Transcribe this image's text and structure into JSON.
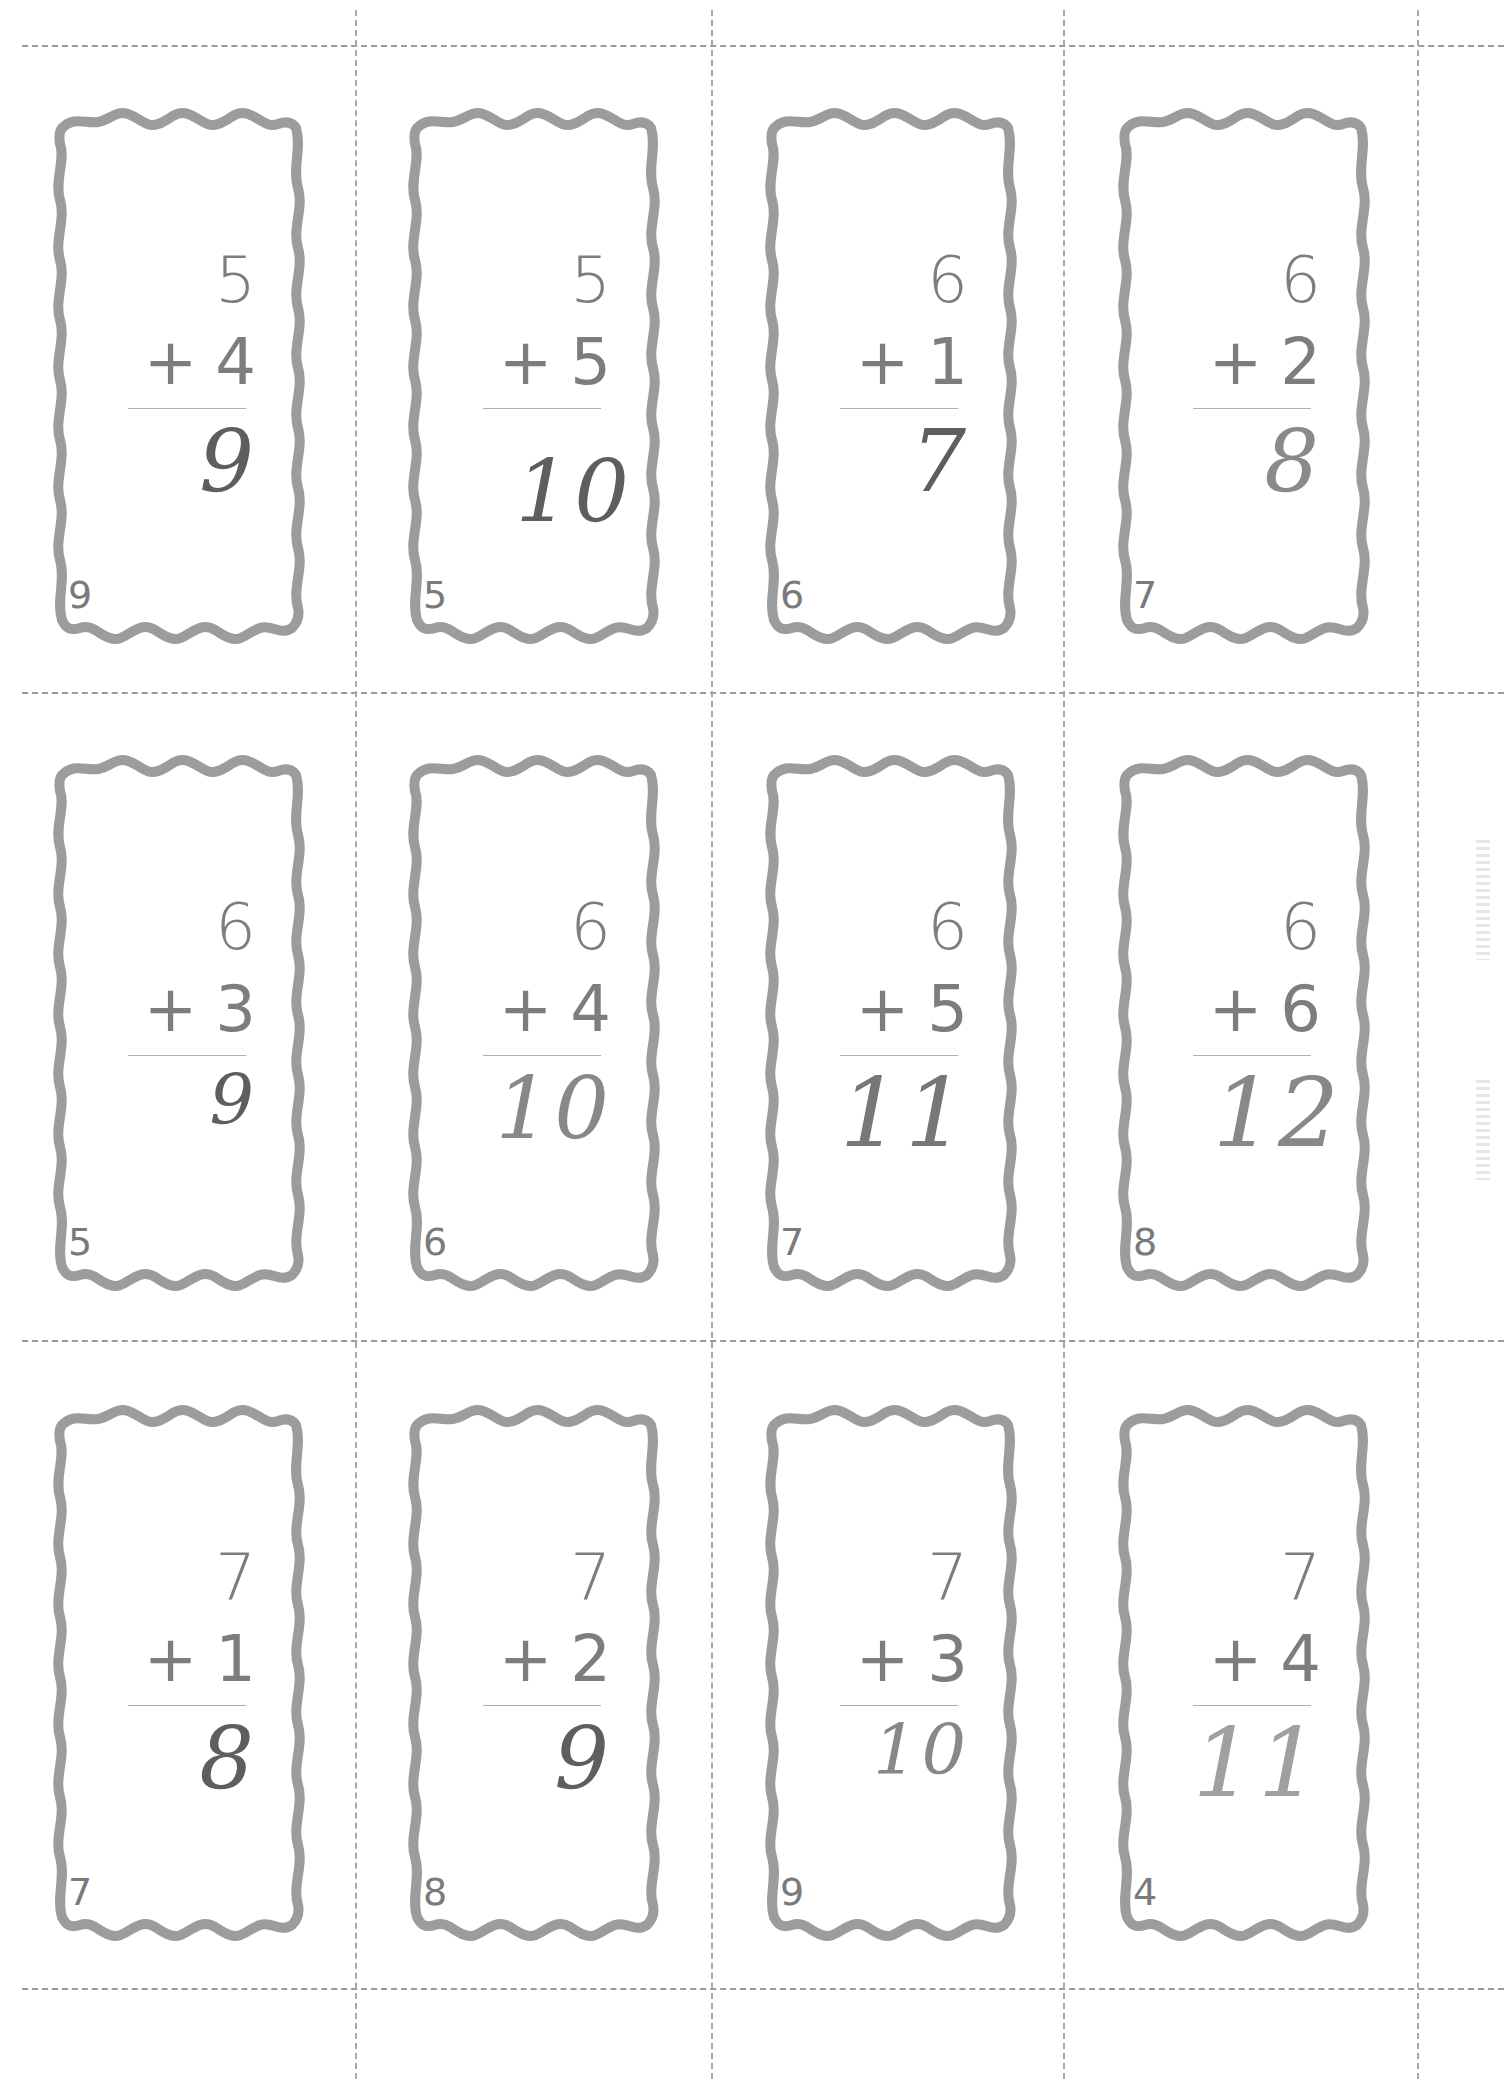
{
  "document": {
    "type": "addition flash cards worksheet",
    "colors": {
      "frame": "#9c9c9c",
      "printed_text": "#7d7d7d",
      "handwriting": "#5e5e5e",
      "cut_lines": "#9a9a9a"
    }
  },
  "rows": [
    {
      "cards": [
        {
          "top": "5",
          "operator": "+",
          "bottom": "4",
          "answer": "9",
          "number": "9"
        },
        {
          "top": "5",
          "operator": "+",
          "bottom": "5",
          "answer": "10",
          "number": "5"
        },
        {
          "top": "6",
          "operator": "+",
          "bottom": "1",
          "answer": "7",
          "number": "6"
        },
        {
          "top": "6",
          "operator": "+",
          "bottom": "2",
          "answer": "8",
          "number": "7"
        }
      ]
    },
    {
      "cards": [
        {
          "top": "6",
          "operator": "+",
          "bottom": "3",
          "answer": "9",
          "number": "5"
        },
        {
          "top": "6",
          "operator": "+",
          "bottom": "4",
          "answer": "10",
          "number": "6"
        },
        {
          "top": "6",
          "operator": "+",
          "bottom": "5",
          "answer": "11",
          "number": "7"
        },
        {
          "top": "6",
          "operator": "+",
          "bottom": "6",
          "answer": "12",
          "number": "8"
        }
      ]
    },
    {
      "cards": [
        {
          "top": "7",
          "operator": "+",
          "bottom": "1",
          "answer": "8",
          "number": "7"
        },
        {
          "top": "7",
          "operator": "+",
          "bottom": "2",
          "answer": "9",
          "number": "8"
        },
        {
          "top": "7",
          "operator": "+",
          "bottom": "3",
          "answer": "10",
          "number": "9"
        },
        {
          "top": "7",
          "operator": "+",
          "bottom": "4",
          "answer": "11",
          "number": "4"
        }
      ]
    }
  ]
}
